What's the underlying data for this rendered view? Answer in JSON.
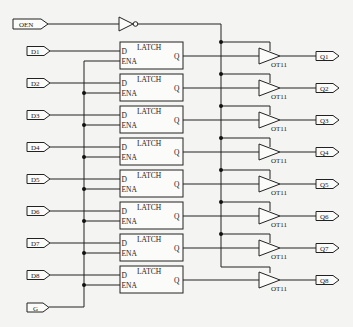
{
  "diagram": {
    "type": "digital-logic-schematic",
    "input_pins": [
      "OEN",
      "D1",
      "D2",
      "D3",
      "D4",
      "D5",
      "D6",
      "D7",
      "D8",
      "G"
    ],
    "output_pins": [
      "Q1",
      "Q2",
      "Q3",
      "Q4",
      "Q5",
      "Q6",
      "Q7",
      "Q8"
    ],
    "inverter": {
      "input": "OEN"
    },
    "latch": {
      "title": "LATCH",
      "port_d": "D",
      "port_ena": "ENA",
      "port_q": "Q",
      "count": 8
    },
    "buffer": {
      "label": "OT11",
      "count": 8
    },
    "latches": [
      {
        "title": "LATCH",
        "d": "D",
        "ena": "ENA",
        "q": "Q",
        "input": "D1",
        "output": "Q1",
        "buffer": "OT11"
      },
      {
        "title": "LATCH",
        "d": "D",
        "ena": "ENA",
        "q": "Q",
        "input": "D2",
        "output": "Q2",
        "buffer": "OT11"
      },
      {
        "title": "LATCH",
        "d": "D",
        "ena": "ENA",
        "q": "Q",
        "input": "D3",
        "output": "Q3",
        "buffer": "OT11"
      },
      {
        "title": "LATCH",
        "d": "D",
        "ena": "ENA",
        "q": "Q",
        "input": "D4",
        "output": "Q4",
        "buffer": "OT11"
      },
      {
        "title": "LATCH",
        "d": "D",
        "ena": "ENA",
        "q": "Q",
        "input": "D5",
        "output": "Q5",
        "buffer": "OT11"
      },
      {
        "title": "LATCH",
        "d": "D",
        "ena": "ENA",
        "q": "Q",
        "input": "D6",
        "output": "Q6",
        "buffer": "OT11"
      },
      {
        "title": "LATCH",
        "d": "D",
        "ena": "ENA",
        "q": "Q",
        "input": "D7",
        "output": "Q7",
        "buffer": "OT11"
      },
      {
        "title": "LATCH",
        "d": "D",
        "ena": "ENA",
        "q": "Q",
        "input": "D8",
        "output": "Q8",
        "buffer": "OT11"
      }
    ],
    "enable_input": "G",
    "output_enable_input": "OEN"
  }
}
